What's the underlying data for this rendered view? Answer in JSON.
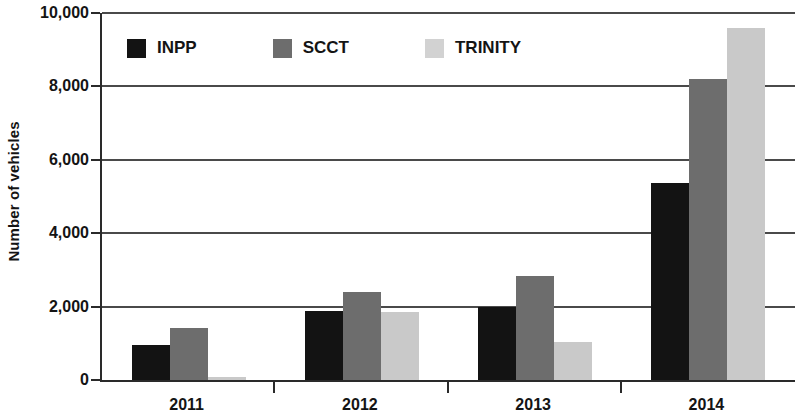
{
  "chart_data": {
    "type": "bar",
    "title": "",
    "xlabel": "",
    "ylabel": "Number of vehicles",
    "categories": [
      "2011",
      "2012",
      "2013",
      "2014"
    ],
    "series": [
      {
        "name": "INPP",
        "color": "#131313",
        "values": [
          960,
          1870,
          2000,
          5360
        ]
      },
      {
        "name": "SCCT",
        "color": "#6d6d6d",
        "values": [
          1430,
          2400,
          2830,
          8200
        ]
      },
      {
        "name": "TRINITY",
        "color": "#c9c9c9",
        "values": [
          80,
          1860,
          1030,
          9600
        ]
      }
    ],
    "ylim": [
      0,
      10000
    ],
    "y_ticks": [
      0,
      2000,
      4000,
      6000,
      8000,
      10000
    ],
    "y_tick_labels": [
      "0",
      "2,000",
      "4,000",
      "6,000",
      "8,000",
      "10,000"
    ],
    "grid": true,
    "grid_axis": "y",
    "legend_position": "top-left-inside"
  },
  "axes": {
    "y_title": "Number of vehicles",
    "y_tick_labels": [
      "10,000",
      "8,000",
      "6,000",
      "4,000",
      "2,000",
      "0"
    ],
    "x_tick_labels": [
      "2011",
      "2012",
      "2013",
      "2014"
    ]
  },
  "legend": {
    "items": [
      {
        "label": "INPP",
        "swatch": "inpp"
      },
      {
        "label": "SCCT",
        "swatch": "scct"
      },
      {
        "label": "TRINITY",
        "swatch": "trinity"
      }
    ]
  }
}
